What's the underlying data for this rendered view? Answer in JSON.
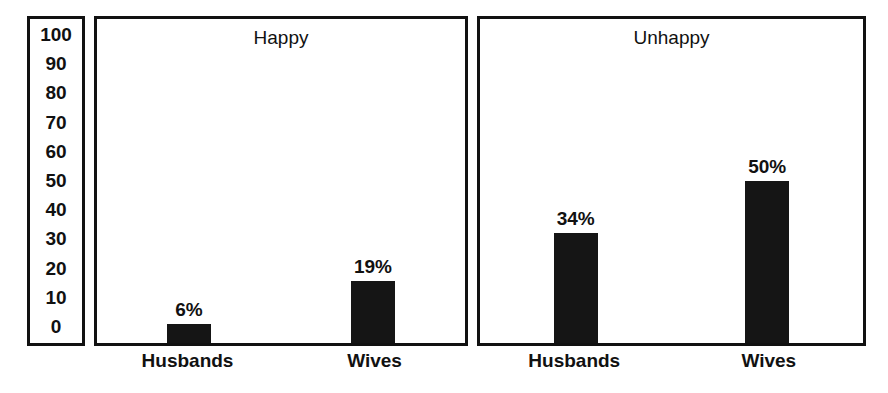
{
  "chart_data": {
    "type": "bar",
    "title": "",
    "xlabel": "",
    "ylabel": "",
    "ylim": [
      0,
      100
    ],
    "y_ticks": [
      "100",
      "90",
      "80",
      "70",
      "60",
      "50",
      "40",
      "30",
      "20",
      "10",
      "0"
    ],
    "grid": false,
    "legend": "none",
    "categories": [
      "Husbands",
      "Wives"
    ],
    "panels": [
      {
        "title": "Happy",
        "bars": [
          {
            "category": "Husbands",
            "value": 6,
            "label": "6%"
          },
          {
            "category": "Wives",
            "value": 19,
            "label": "19%"
          }
        ]
      },
      {
        "title": "Unhappy",
        "bars": [
          {
            "category": "Husbands",
            "value": 34,
            "label": "34%"
          },
          {
            "category": "Wives",
            "value": 50,
            "label": "50%"
          }
        ]
      }
    ],
    "colors": {
      "bar": "#151515",
      "border": "#111111",
      "background": "#ffffff",
      "text": "#111111"
    }
  }
}
